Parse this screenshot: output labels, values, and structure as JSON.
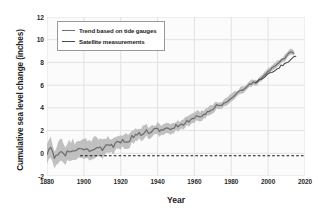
{
  "chart_data": {
    "type": "line",
    "title": "",
    "xlabel": "Year",
    "ylabel": "Cumulative sea level change (inches)",
    "xlim": [
      1880,
      2020
    ],
    "ylim": [
      -2,
      12
    ],
    "xticks": [
      1880,
      1900,
      1920,
      1940,
      1960,
      1980,
      2000,
      2020
    ],
    "yticks": [
      -2,
      0,
      2,
      4,
      6,
      8,
      10,
      12
    ],
    "grid": true,
    "legend_position": "upper left",
    "colors": {
      "trend_line": "#6e6e6e",
      "trend_band": "#bdbdbd",
      "satellite_line": "#4a4a4a",
      "zero_reference": "#111111",
      "gridline": "#e2e2e2",
      "plot_background": "#fbfbfb",
      "axis_text": "#2a2a2a"
    },
    "reference_line": {
      "y": -0.22,
      "style": "dashed",
      "label": ""
    },
    "series": [
      {
        "name": "Trend based on tide gauges",
        "type": "line-with-band",
        "x": [
          1880,
          1882,
          1884,
          1886,
          1888,
          1890,
          1892,
          1894,
          1896,
          1898,
          1900,
          1902,
          1904,
          1906,
          1908,
          1910,
          1912,
          1914,
          1916,
          1918,
          1920,
          1922,
          1924,
          1926,
          1928,
          1930,
          1932,
          1934,
          1936,
          1938,
          1940,
          1942,
          1944,
          1946,
          1948,
          1950,
          1952,
          1954,
          1956,
          1958,
          1960,
          1962,
          1964,
          1966,
          1968,
          1970,
          1972,
          1974,
          1976,
          1978,
          1980,
          1982,
          1984,
          1986,
          1988,
          1990,
          1992,
          1994,
          1996,
          1998,
          2000,
          2002,
          2004,
          2006,
          2008,
          2010,
          2012,
          2014
        ],
        "values": [
          0.05,
          0.55,
          -0.55,
          0.1,
          0.35,
          -0.1,
          0.25,
          0.3,
          0.05,
          0.35,
          0.45,
          0.3,
          0.2,
          0.55,
          0.35,
          0.45,
          0.6,
          0.8,
          0.7,
          0.85,
          1.0,
          1.15,
          1.05,
          1.45,
          1.55,
          1.7,
          1.8,
          1.95,
          1.85,
          2.0,
          2.1,
          1.95,
          2.1,
          2.2,
          2.15,
          2.4,
          2.45,
          2.55,
          2.8,
          2.95,
          3.1,
          3.35,
          3.3,
          3.55,
          3.75,
          3.9,
          4.25,
          4.15,
          4.4,
          4.65,
          4.95,
          5.1,
          5.35,
          5.6,
          5.7,
          6.05,
          6.3,
          6.25,
          6.6,
          6.95,
          7.2,
          7.45,
          7.7,
          8.0,
          8.25,
          8.55,
          8.95,
          8.8
        ],
        "band_lower": [
          -0.75,
          -0.35,
          -1.45,
          -0.7,
          -0.45,
          -0.9,
          -0.55,
          -0.5,
          -0.75,
          -0.45,
          -0.35,
          -0.5,
          -0.6,
          -0.25,
          -0.4,
          -0.3,
          -0.1,
          0.15,
          0.05,
          0.25,
          0.4,
          0.55,
          0.45,
          0.9,
          1.0,
          1.2,
          1.3,
          1.45,
          1.35,
          1.5,
          1.6,
          1.5,
          1.65,
          1.75,
          1.7,
          1.95,
          2.05,
          2.15,
          2.4,
          2.55,
          2.7,
          2.95,
          2.9,
          3.2,
          3.4,
          3.55,
          3.9,
          3.85,
          4.1,
          4.35,
          4.65,
          4.8,
          5.05,
          5.3,
          5.45,
          5.8,
          6.05,
          6.0,
          6.35,
          6.7,
          6.95,
          7.2,
          7.45,
          7.75,
          8.0,
          8.3,
          8.7,
          8.6
        ],
        "band_upper": [
          0.85,
          1.45,
          0.35,
          0.9,
          1.15,
          0.7,
          1.05,
          1.1,
          0.85,
          1.15,
          1.25,
          1.1,
          1.0,
          1.35,
          1.1,
          1.2,
          1.3,
          1.45,
          1.35,
          1.45,
          1.6,
          1.75,
          1.65,
          2.0,
          2.1,
          2.2,
          2.3,
          2.45,
          2.35,
          2.5,
          2.6,
          2.4,
          2.55,
          2.65,
          2.6,
          2.85,
          2.85,
          2.95,
          3.2,
          3.35,
          3.5,
          3.75,
          3.7,
          3.9,
          4.1,
          4.25,
          4.6,
          4.45,
          4.7,
          4.95,
          5.25,
          5.4,
          5.65,
          5.9,
          5.95,
          6.3,
          6.55,
          6.5,
          6.85,
          7.2,
          7.45,
          7.7,
          7.95,
          8.25,
          8.5,
          8.8,
          9.2,
          9.0
        ]
      },
      {
        "name": "Satellite measurements",
        "type": "line",
        "x": [
          1993,
          1995,
          1997,
          1999,
          2001,
          2003,
          2005,
          2007,
          2009,
          2011,
          2013,
          2015
        ],
        "values": [
          6.2,
          6.45,
          6.65,
          6.85,
          7.05,
          7.25,
          7.4,
          7.7,
          7.85,
          8.05,
          8.35,
          8.55
        ]
      }
    ]
  },
  "legend": {
    "items": [
      {
        "label": "Trend based on tide gauges",
        "color": "#6e6e6e"
      },
      {
        "label": "Satellite measurements",
        "color": "#4a4a4a"
      }
    ]
  },
  "axes": {
    "x_title": "Year",
    "y_title": "Cumulative sea level change (inches)",
    "x_tick_labels": [
      "1880",
      "1900",
      "1920",
      "1940",
      "1960",
      "1980",
      "2000",
      "2020"
    ],
    "y_tick_labels": [
      "12",
      "10",
      "8",
      "6",
      "4",
      "2",
      "0",
      "-2"
    ]
  }
}
